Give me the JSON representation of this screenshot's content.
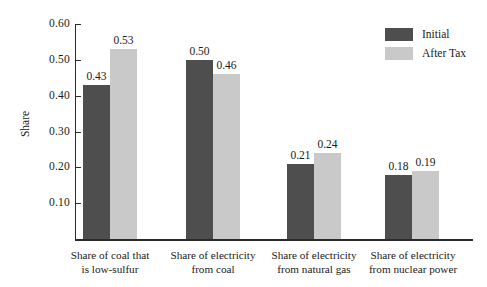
{
  "chart_data": {
    "type": "bar",
    "title": "",
    "xlabel": "",
    "ylabel": "Share",
    "ylim": [
      0.0,
      0.6
    ],
    "ytick_labels": [
      "0.60",
      "0.50",
      "0.40",
      "0.30",
      "0.20",
      "0.10"
    ],
    "ytick_values": [
      0.6,
      0.5,
      0.4,
      0.3,
      0.2,
      0.1
    ],
    "grid": false,
    "legend_position": "top-right",
    "categories": [
      "Share of coal that is low-sulfur",
      "Share of electricity from coal",
      "Share of electricity from natural gas",
      "Share of electricity from nuclear power"
    ],
    "category_lines": [
      [
        "Share of coal that",
        "is low-sulfur"
      ],
      [
        "Share of electricity",
        "from coal"
      ],
      [
        "Share of electricity",
        "from natural gas"
      ],
      [
        "Share of electricity",
        "from nuclear power"
      ]
    ],
    "series": [
      {
        "name": "Initial",
        "color": "#4e4e4e",
        "values": [
          0.43,
          0.5,
          0.21,
          0.18
        ],
        "labels": [
          "0.43",
          "0.50",
          "0.21",
          "0.18"
        ]
      },
      {
        "name": "After Tax",
        "color": "#c9c9c9",
        "values": [
          0.53,
          0.46,
          0.24,
          0.19
        ],
        "labels": [
          "0.53",
          "0.46",
          "0.24",
          "0.19"
        ]
      }
    ]
  },
  "legend": {
    "items": [
      {
        "label": "Initial",
        "color": "#4e4e4e"
      },
      {
        "label": "After Tax",
        "color": "#c9c9c9"
      }
    ]
  }
}
